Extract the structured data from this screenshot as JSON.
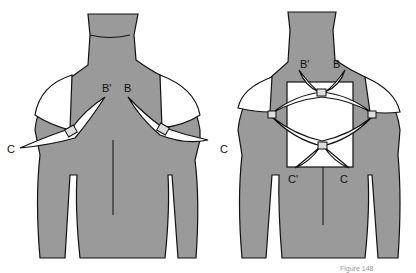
{
  "figures": [
    {
      "id": "left",
      "labels": {
        "b_prime": "B'",
        "b": "B",
        "c_left": "C",
        "c_right": "C"
      }
    },
    {
      "id": "right",
      "labels": {
        "b_prime": "B'",
        "b": "B",
        "c_prime": "C'",
        "c": "C",
        "c_outer": "C"
      }
    }
  ],
  "caption": "Figure 148"
}
